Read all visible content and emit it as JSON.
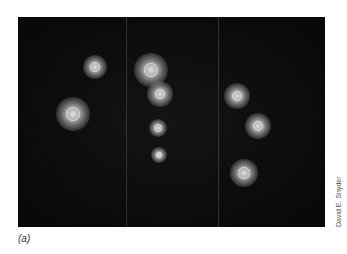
{
  "figure": {
    "label": "(a)",
    "credit": "David E. Snyder"
  }
}
